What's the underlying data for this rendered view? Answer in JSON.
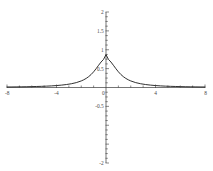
{
  "chart_data": {
    "type": "line",
    "title": "",
    "subtitle": "",
    "xlabel": "",
    "ylabel": "",
    "xlim": [
      -8,
      8
    ],
    "ylim": [
      -2,
      2
    ],
    "grid": false,
    "legend": null,
    "x_major_ticks": [
      -8,
      -4,
      0,
      4,
      8
    ],
    "x_major_tick_labels": [
      "-8",
      "-4",
      "0",
      "4",
      "8"
    ],
    "x_minor_tick_step": 1,
    "y_major_ticks": [
      -2,
      -1.5,
      -1,
      -0.5,
      0,
      0.5,
      1,
      1.5,
      2
    ],
    "y_major_tick_labels": [
      "-2",
      "-1.5",
      "-1",
      "-0.5",
      "0",
      "0.5",
      "1",
      "1.5",
      "2"
    ],
    "y_labeled_ticks": [
      -2,
      -0.5,
      0,
      0.5,
      1,
      1.5,
      2
    ],
    "y_labeled_tick_labels": [
      "-2",
      "-0.5",
      "0",
      "0.5",
      "1",
      "1.5",
      "2"
    ],
    "y_minor_tick_step": 0.125,
    "axes_style": "centered-crosshair",
    "curve_color": "#1a1a1a",
    "axis_color": "#3a3a3a",
    "label_color": "#4a4a4a",
    "background_color": "#ffffff",
    "peak": {
      "x": 0,
      "y": 0.87
    },
    "series": [
      {
        "name": "curve",
        "x": [
          -8.0,
          -7.6,
          -7.2,
          -6.8,
          -6.4,
          -6.0,
          -5.6,
          -5.2,
          -4.8,
          -4.4,
          -4.0,
          -3.6,
          -3.2,
          -2.8,
          -2.4,
          -2.0,
          -1.8,
          -1.6,
          -1.4,
          -1.2,
          -1.0,
          -0.8,
          -0.6,
          -0.4,
          -0.2,
          0.0,
          0.2,
          0.4,
          0.6,
          0.8,
          1.0,
          1.2,
          1.4,
          1.6,
          1.8,
          2.0,
          2.4,
          2.8,
          3.2,
          3.6,
          4.0,
          4.4,
          4.8,
          5.2,
          5.6,
          6.0,
          6.4,
          6.8,
          7.2,
          7.6,
          8.0
        ],
        "y": [
          0.0134,
          0.0148,
          0.0165,
          0.0184,
          0.0207,
          0.0235,
          0.0269,
          0.0311,
          0.0363,
          0.043,
          0.0517,
          0.0631,
          0.0784,
          0.0995,
          0.1293,
          0.174,
          0.204,
          0.241,
          0.2873,
          0.345,
          0.4156,
          0.4985,
          0.5883,
          0.6747,
          0.7442,
          0.87,
          0.7442,
          0.6747,
          0.5883,
          0.4985,
          0.4156,
          0.345,
          0.2873,
          0.241,
          0.204,
          0.174,
          0.1293,
          0.0995,
          0.0784,
          0.0631,
          0.0517,
          0.043,
          0.0363,
          0.0311,
          0.0269,
          0.0235,
          0.0207,
          0.0184,
          0.0165,
          0.0148,
          0.0134
        ]
      }
    ],
    "annotations": []
  }
}
